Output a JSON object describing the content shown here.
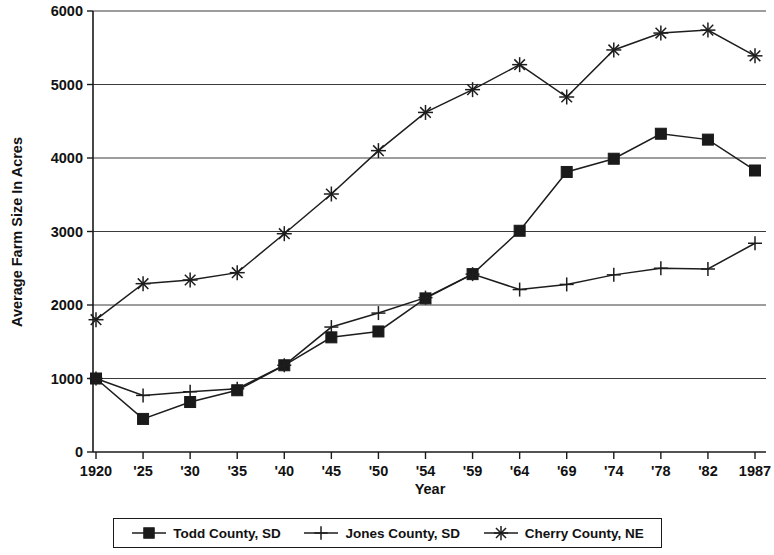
{
  "chart_data": {
    "type": "line",
    "title": "",
    "xlabel": "Year",
    "ylabel": "Average Farm Size In Acres",
    "categories": [
      "1920",
      "'25",
      "'30",
      "'35",
      "'40",
      "'45",
      "'50",
      "'54",
      "'59",
      "'64",
      "'69",
      "'74",
      "'78",
      "'82",
      "1987"
    ],
    "x_tick_labels": [
      "1920",
      "'25",
      "'30",
      "'35",
      "'40",
      "'45",
      "'50",
      "'54",
      "'59",
      "'64",
      "'69",
      "'74",
      "'78",
      "'82",
      "1987"
    ],
    "y_tick_labels": [
      "0",
      "1000",
      "2000",
      "3000",
      "4000",
      "5000",
      "6000"
    ],
    "y_ticks": [
      0,
      1000,
      2000,
      3000,
      4000,
      5000,
      6000
    ],
    "ylim": [
      0,
      6000
    ],
    "grid": "horizontal",
    "legend_position": "bottom",
    "series": [
      {
        "name": "Todd County, SD",
        "marker": "filled-square",
        "values": [
          1000,
          450,
          680,
          840,
          1180,
          1560,
          1640,
          2090,
          2420,
          3010,
          3810,
          3990,
          4330,
          4250,
          3830
        ]
      },
      {
        "name": "Jones County, SD",
        "marker": "plus",
        "values": [
          1000,
          770,
          820,
          860,
          1180,
          1700,
          1890,
          2100,
          2420,
          2210,
          2280,
          2410,
          2500,
          2490,
          2840
        ]
      },
      {
        "name": "Cherry County, NE",
        "marker": "asterisk",
        "values": [
          1800,
          2290,
          2340,
          2440,
          2970,
          3510,
          4100,
          4620,
          4930,
          5270,
          4830,
          5470,
          5700,
          5740,
          5390
        ]
      }
    ]
  },
  "legend": {
    "entries": [
      {
        "label": "Todd County, SD",
        "marker": "filled-square"
      },
      {
        "label": "Jones County, SD",
        "marker": "plus"
      },
      {
        "label": "Cherry County, NE",
        "marker": "asterisk"
      }
    ]
  },
  "axes": {
    "x_title": "Year",
    "y_title": "Average Farm Size In Acres"
  }
}
